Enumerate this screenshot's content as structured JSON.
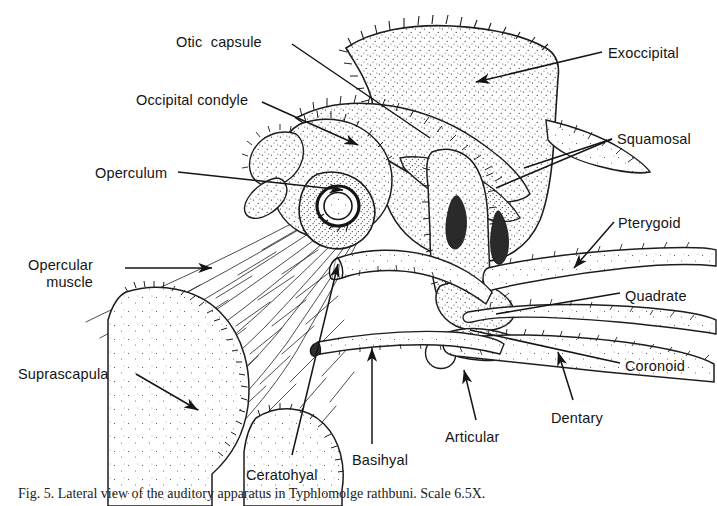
{
  "figure": {
    "type": "anatomical-line-drawing",
    "background_color": "#ffffff",
    "ink_color": "#151515",
    "caption": "Fig. 5. Lateral view of the auditory apparatus in Typhlomolge rathbuni. Scale 6.5X.",
    "labels": [
      {
        "id": "otic-capsule",
        "text": "Otic  capsule",
        "x": 176,
        "y": 34,
        "anchor": "left",
        "lines": [
          "Otic  capsule"
        ]
      },
      {
        "id": "occipital-condyle",
        "text": "Occipital condyle",
        "x": 136,
        "y": 92,
        "anchor": "left",
        "lines": [
          "Occipital condyle"
        ]
      },
      {
        "id": "operculum",
        "text": "Operculum",
        "x": 95,
        "y": 165,
        "anchor": "left",
        "lines": [
          "Operculum"
        ]
      },
      {
        "id": "opercular-muscle",
        "text": "Opercular muscle",
        "x": 28,
        "y": 257,
        "anchor": "right",
        "lines": [
          "Opercular",
          "muscle"
        ]
      },
      {
        "id": "suprascapula",
        "text": "Suprascapula",
        "x": 18,
        "y": 366,
        "anchor": "left",
        "lines": [
          "Suprascapula"
        ]
      },
      {
        "id": "ceratohyal",
        "text": "Ceratohyal",
        "x": 246,
        "y": 467,
        "anchor": "left",
        "lines": [
          "Ceratohyal"
        ]
      },
      {
        "id": "basihyal",
        "text": "Basihyal",
        "x": 352,
        "y": 452,
        "anchor": "left",
        "lines": [
          "Basihyal"
        ]
      },
      {
        "id": "articular",
        "text": "Articular",
        "x": 445,
        "y": 429,
        "anchor": "left",
        "lines": [
          "Articular"
        ]
      },
      {
        "id": "dentary",
        "text": "Dentary",
        "x": 551,
        "y": 410,
        "anchor": "left",
        "lines": [
          "Dentary"
        ]
      },
      {
        "id": "coronoid",
        "text": "Coronoid",
        "x": 625,
        "y": 358,
        "anchor": "left",
        "lines": [
          "Coronoid"
        ]
      },
      {
        "id": "quadrate",
        "text": "Quadrate",
        "x": 625,
        "y": 288,
        "anchor": "left",
        "lines": [
          "Quadrate"
        ]
      },
      {
        "id": "pterygoid",
        "text": "Pterygoid",
        "x": 618,
        "y": 215,
        "anchor": "left",
        "lines": [
          "Pterygoid"
        ]
      },
      {
        "id": "squamosal",
        "text": "Squamosal",
        "x": 617,
        "y": 131,
        "anchor": "left",
        "lines": [
          "Squamosal"
        ]
      },
      {
        "id": "exoccipital",
        "text": "Exoccipital",
        "x": 608,
        "y": 45,
        "anchor": "left",
        "lines": [
          "Exoccipital"
        ]
      }
    ],
    "leader_lines": [
      {
        "id": "leader-otic-capsule",
        "from": [
          292,
          44
        ],
        "to": [
          430,
          138
        ],
        "arrow": false
      },
      {
        "id": "leader-occipital-condyle",
        "from": [
          262,
          102
        ],
        "to": [
          358,
          145
        ],
        "arrow": true
      },
      {
        "id": "leader-operculum",
        "from": [
          178,
          172
        ],
        "to": [
          343,
          190
        ],
        "arrow": true
      },
      {
        "id": "leader-opercular-muscle",
        "from": [
          125,
          268
        ],
        "to": [
          212,
          268
        ],
        "arrow": true
      },
      {
        "id": "leader-suprascapula",
        "from": [
          136,
          374
        ],
        "to": [
          198,
          410
        ],
        "arrow": true
      },
      {
        "id": "leader-ceratohyal",
        "from": [
          292,
          455
        ],
        "to": [
          338,
          264
        ],
        "arrow": true
      },
      {
        "id": "leader-basihyal",
        "from": [
          372,
          444
        ],
        "to": [
          372,
          348
        ],
        "arrow": true
      },
      {
        "id": "leader-articular",
        "from": [
          476,
          420
        ],
        "to": [
          464,
          370
        ],
        "arrow": true
      },
      {
        "id": "leader-dentary",
        "from": [
          573,
          400
        ],
        "to": [
          558,
          352
        ],
        "arrow": true
      },
      {
        "id": "leader-coronoid",
        "from": [
          620,
          363
        ],
        "to": [
          470,
          330
        ],
        "arrow": false
      },
      {
        "id": "leader-quadrate",
        "from": [
          620,
          293
        ],
        "to": [
          496,
          314
        ],
        "arrow": false
      },
      {
        "id": "leader-pterygoid",
        "from": [
          614,
          222
        ],
        "to": [
          574,
          268
        ],
        "arrow": true
      },
      {
        "id": "leader-squamosal",
        "from": [
          612,
          139
        ],
        "to": [
          524,
          168
        ],
        "arrow": false
      },
      {
        "id": "leader-squamosal-2",
        "from": [
          612,
          139
        ],
        "to": [
          496,
          188
        ],
        "arrow": false
      },
      {
        "id": "leader-exoccipital",
        "from": [
          602,
          52
        ],
        "to": [
          476,
          82
        ],
        "arrow": true
      }
    ]
  }
}
